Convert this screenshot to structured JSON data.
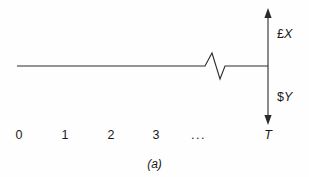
{
  "figure": {
    "caption": "(a)",
    "stroke_color": "#2b2b2b",
    "background_color": "#fefefe"
  },
  "vertical_axis": {
    "name": "double-headed-arrow-axis",
    "upper_label": {
      "currency": "£",
      "variable": "X"
    },
    "lower_label": {
      "currency": "$",
      "variable": "Y"
    },
    "terminal_label": "T"
  },
  "time_axis": {
    "ticks": [
      "0",
      "1",
      "2",
      "3"
    ],
    "ellipsis": "...",
    "terminal": "T"
  },
  "chart_data": {
    "type": "line",
    "title": "(a)",
    "xlabel": "",
    "ylabel": "",
    "categories": [
      "0",
      "1",
      "2",
      "3",
      "...",
      "T"
    ],
    "x": [
      0,
      1,
      2,
      3,
      4,
      5
    ],
    "values": [
      0,
      0,
      0,
      0,
      0,
      0
    ],
    "annotations": [
      {
        "text": "£X",
        "position": "upper-right",
        "meaning": "inflow amount in pounds"
      },
      {
        "text": "$Y",
        "position": "lower-right",
        "meaning": "outflow amount in dollars"
      },
      {
        "text": "T",
        "position": "x-axis-end",
        "meaning": "terminal time period"
      }
    ],
    "series": [
      {
        "name": "cash-flow-baseline",
        "points": [
          [
            17,
            66
          ],
          [
            205,
            66
          ],
          [
            212,
            53
          ],
          [
            220,
            79
          ],
          [
            225,
            66
          ],
          [
            268,
            66
          ]
        ]
      }
    ],
    "grid": false,
    "legend": null
  }
}
